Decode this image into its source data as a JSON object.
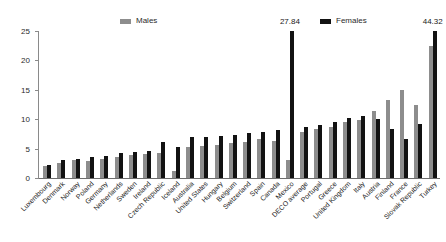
{
  "chart_data": {
    "type": "bar",
    "title": "",
    "subtitle": "",
    "xlabel": "",
    "ylabel": "",
    "ylim": [
      0,
      25
    ],
    "yticks": [
      0,
      5,
      10,
      15,
      20,
      25
    ],
    "grid": false,
    "legend_position": "top",
    "legend": [
      {
        "name": "Males",
        "color": "#8d8d8d"
      },
      {
        "name": "Females",
        "color": "#121212"
      }
    ],
    "categories": [
      "Luxembourg",
      "Denmark",
      "Norway",
      "Poland",
      "Germany",
      "Netherlands",
      "Sweden",
      "Ireland",
      "Czech Republic",
      "Iceland",
      "Australia",
      "United States",
      "Hungary",
      "Belgium",
      "Switzerland",
      "Spain",
      "Canada",
      "Mexico",
      "DECO average",
      "Portugal",
      "Greece",
      "United Kingdom",
      "Italy",
      "Austria",
      "Finland",
      "France",
      "Slovak Republic",
      "Turkey"
    ],
    "series": [
      {
        "name": "Males",
        "color": "#8d8d8d",
        "values": [
          2.0,
          2.6,
          3.0,
          2.9,
          3.3,
          3.6,
          3.9,
          4.0,
          4.2,
          1.2,
          5.2,
          5.4,
          5.6,
          5.9,
          6.2,
          6.6,
          6.3,
          3.0,
          7.8,
          8.4,
          8.7,
          9.6,
          9.9,
          11.4,
          13.2,
          14.9,
          12.4,
          22.5
        ]
      },
      {
        "name": "Females",
        "color": "#121212",
        "values": [
          2.2,
          3.0,
          3.2,
          3.6,
          3.8,
          4.2,
          4.4,
          4.6,
          6.1,
          5.2,
          6.9,
          7.0,
          7.2,
          7.4,
          7.6,
          7.9,
          8.1,
          27.84,
          8.6,
          9.1,
          9.5,
          10.2,
          10.6,
          10.1,
          8.4,
          6.6,
          9.2,
          44.32
        ]
      }
    ],
    "annotations": [
      {
        "category": "Mexico",
        "series": "Females",
        "label": "27.84"
      },
      {
        "category": "Turkey",
        "series": "Females",
        "label": "44.32"
      }
    ]
  }
}
